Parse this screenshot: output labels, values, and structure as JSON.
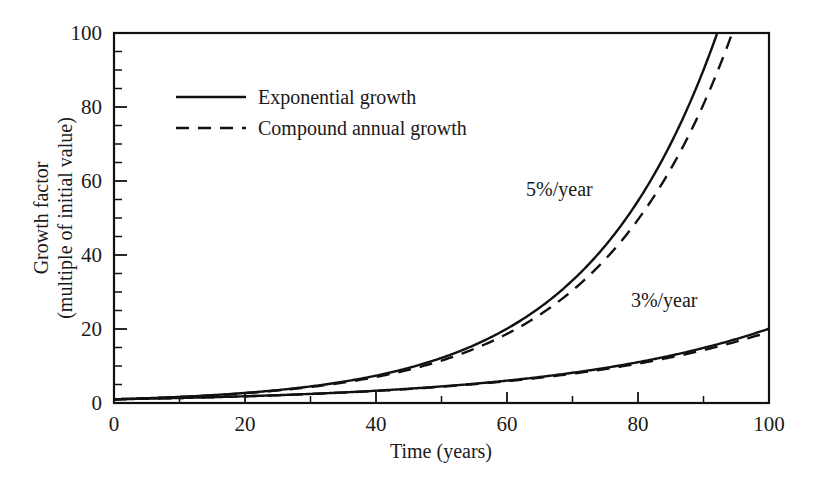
{
  "chart_data": {
    "type": "line",
    "title": "",
    "xlabel": "Time (years)",
    "ylabel_line1": "Growth factor",
    "ylabel_line2": "(multiple of initial value)",
    "xlim": [
      0,
      100
    ],
    "ylim": [
      0,
      100
    ],
    "xticks": [
      0,
      20,
      40,
      60,
      80,
      100
    ],
    "xtick_labels": [
      "0",
      "20",
      "40",
      "60",
      "80",
      "100"
    ],
    "yticks": [
      0,
      20,
      40,
      60,
      80,
      100
    ],
    "ytick_labels": [
      "0",
      "20",
      "40",
      "60",
      "80",
      "100"
    ],
    "x_minor_step": 10,
    "y_minor_step": 5,
    "grid": false,
    "legend_position": "upper-left-inside",
    "legend": [
      {
        "label": "Exponential growth",
        "style": "solid"
      },
      {
        "label": "Compound annual growth",
        "style": "dashed"
      }
    ],
    "annotations": [
      {
        "text": "5%/year",
        "x": 68,
        "y": 56
      },
      {
        "text": "3%/year",
        "x": 84,
        "y": 26
      }
    ],
    "x": [
      0,
      5,
      10,
      15,
      20,
      25,
      30,
      35,
      40,
      45,
      50,
      55,
      60,
      65,
      70,
      75,
      80,
      85,
      90,
      91.6,
      95,
      100
    ],
    "series": [
      {
        "name": "Exponential growth 5%/year",
        "style": "solid",
        "rate_percent": 5,
        "formula": "exp(0.05t)",
        "values": [
          1.0,
          1.28,
          1.65,
          2.12,
          2.72,
          3.49,
          4.48,
          5.75,
          7.39,
          9.49,
          12.18,
          15.64,
          20.09,
          25.79,
          33.12,
          42.52,
          54.6,
          70.11,
          90.02,
          97.51,
          115.58,
          148.41
        ]
      },
      {
        "name": "Compound annual growth 5%/year",
        "style": "dashed",
        "rate_percent": 5,
        "formula": "1.05^t",
        "values": [
          1.0,
          1.28,
          1.63,
          2.08,
          2.65,
          3.39,
          4.32,
          5.52,
          7.04,
          8.99,
          11.47,
          14.64,
          18.68,
          23.84,
          30.43,
          38.83,
          49.56,
          63.25,
          80.73,
          87.39,
          108.19,
          131.5
        ]
      },
      {
        "name": "Exponential growth 3%/year",
        "style": "solid",
        "rate_percent": 3,
        "formula": "exp(0.03t)",
        "values": [
          1.0,
          1.16,
          1.35,
          1.57,
          1.82,
          2.12,
          2.46,
          2.86,
          3.32,
          3.86,
          4.48,
          5.21,
          6.05,
          7.03,
          8.17,
          9.49,
          11.02,
          12.81,
          14.88,
          15.57,
          17.29,
          20.09
        ]
      },
      {
        "name": "Compound annual growth 3%/year",
        "style": "dashed",
        "rate_percent": 3,
        "formula": "1.03^t",
        "values": [
          1.0,
          1.16,
          1.34,
          1.56,
          1.81,
          2.09,
          2.43,
          2.81,
          3.26,
          3.78,
          4.38,
          5.08,
          5.89,
          6.83,
          7.92,
          9.18,
          10.64,
          12.34,
          14.3,
          14.93,
          16.58,
          19.22
        ]
      }
    ]
  }
}
